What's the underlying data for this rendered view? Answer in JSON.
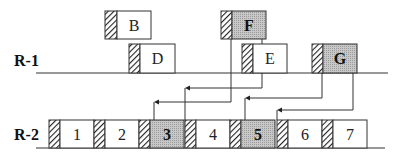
{
  "rows": [
    {
      "label": "R-1",
      "baseline_y": 73
    },
    {
      "label": "R-2",
      "baseline_y": 148
    }
  ],
  "upper_blocks": [
    {
      "label": "B",
      "hatch_x": 105,
      "x": 117,
      "w": 34,
      "y": 11,
      "h": 28,
      "shaded": false,
      "bold": false
    },
    {
      "label": "F",
      "hatch_x": 221,
      "x": 232,
      "w": 34,
      "y": 11,
      "h": 28,
      "shaded": true,
      "bold": true
    }
  ],
  "r1_blocks": [
    {
      "label": "D",
      "hatch_x": 129,
      "x": 140,
      "w": 35,
      "y": 44,
      "h": 29,
      "shaded": false,
      "bold": false
    },
    {
      "label": "E",
      "hatch_x": 242,
      "x": 253,
      "w": 34,
      "y": 44,
      "h": 29,
      "shaded": false,
      "bold": false
    },
    {
      "label": "G",
      "hatch_x": 312,
      "x": 323,
      "w": 34,
      "y": 44,
      "h": 29,
      "shaded": true,
      "bold": true
    }
  ],
  "r2_blocks": [
    {
      "label": "1",
      "hatch_x": 49,
      "x": 60,
      "w": 34,
      "shaded": false,
      "bold": false
    },
    {
      "label": "2",
      "hatch_x": 94,
      "x": 105,
      "w": 34,
      "shaded": false,
      "bold": false
    },
    {
      "label": "3",
      "hatch_x": 139,
      "x": 150,
      "w": 34,
      "shaded": true,
      "bold": true
    },
    {
      "label": "4",
      "hatch_x": 185,
      "x": 196,
      "w": 34,
      "shaded": false,
      "bold": false
    },
    {
      "label": "5",
      "hatch_x": 230,
      "x": 241,
      "w": 34,
      "shaded": true,
      "bold": true
    },
    {
      "label": "6",
      "hatch_x": 277,
      "x": 288,
      "w": 34,
      "shaded": false,
      "bold": false
    },
    {
      "label": "7",
      "hatch_x": 322,
      "x": 333,
      "w": 34,
      "shaded": false,
      "bold": false
    }
  ],
  "arrows": [
    {
      "from_x": 231,
      "from_y": 39,
      "turn_y": 102,
      "to_x": 154,
      "to_y": 120
    },
    {
      "from_x": 262,
      "from_y": 39,
      "turn_y": 88,
      "to_x": 185,
      "to_y": 120
    },
    {
      "from_x": 322,
      "from_y": 73,
      "turn_y": 98,
      "to_x": 245,
      "to_y": 120
    },
    {
      "from_x": 353,
      "from_y": 73,
      "turn_y": 110,
      "to_x": 277,
      "to_y": 120
    }
  ],
  "colors": {
    "stroke": "#333333",
    "shade": "#bdbdbd",
    "hatch": "#222222"
  }
}
